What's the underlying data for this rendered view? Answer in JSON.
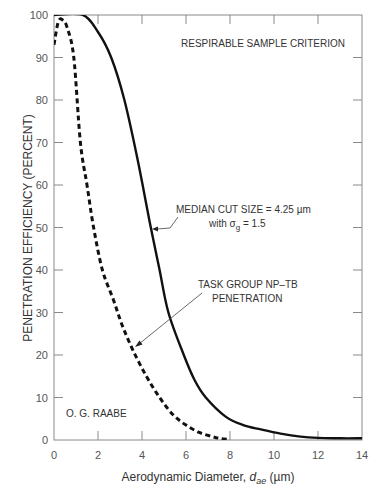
{
  "chart_data": {
    "type": "line",
    "title": "RESPIRABLE SAMPLE CRITERION",
    "xlabel": "Aerodynamic Diameter, d_ae (µm)",
    "xlabel_prefix": "Aerodynamic Diameter, ",
    "xlabel_var": "d",
    "xlabel_sub": "ae",
    "xlabel_unit": " (µm)",
    "ylabel": "PENETRATION EFFICIENCY (PERCENT)",
    "xlim": [
      0,
      14
    ],
    "ylim": [
      0,
      100
    ],
    "xticks": [
      0,
      2,
      4,
      6,
      8,
      10,
      12,
      14
    ],
    "yticks": [
      0,
      10,
      20,
      30,
      40,
      50,
      60,
      70,
      80,
      90,
      100
    ],
    "grid": false,
    "series": [
      {
        "name": "Respirable sample criterion (median cut size = 4.25 µm, σg = 1.5)",
        "style": "solid",
        "x": [
          0,
          1.3,
          2.0,
          2.6,
          3.2,
          3.8,
          4.4,
          4.8,
          5.2,
          5.9,
          6.4,
          6.9,
          7.8,
          8.6,
          9.4,
          10.3,
          11.2,
          12.0,
          13.0,
          14.0
        ],
        "y": [
          100,
          100,
          96,
          90,
          80,
          66,
          50,
          40,
          30,
          20,
          14,
          10,
          5.5,
          3.5,
          2.5,
          1.5,
          0.8,
          0.5,
          0.4,
          0.4
        ]
      },
      {
        "name": "Task Group NP-TB penetration",
        "style": "dashed",
        "x": [
          0,
          0.2,
          0.4,
          0.6,
          0.9,
          1.2,
          1.5,
          1.8,
          2.2,
          2.7,
          3.1,
          3.6,
          4.2,
          4.8,
          5.4,
          6.0,
          6.6,
          7.2,
          7.6,
          8.0
        ],
        "y": [
          93,
          98.5,
          98.8,
          97,
          90,
          70,
          60,
          50,
          40,
          33,
          27,
          21,
          15,
          10,
          6,
          3.5,
          1.8,
          0.8,
          0.3,
          0.1
        ]
      }
    ],
    "annotations": [
      {
        "text": "RESPIRABLE SAMPLE CRITERION"
      },
      {
        "text": "MEDIAN CUT SIZE = 4.25 µm"
      },
      {
        "text": "with σ",
        "sub": "g",
        "after": " = 1.5"
      },
      {
        "text": "TASK GROUP NP–TB"
      },
      {
        "text": "PENETRATION"
      },
      {
        "text": "O. G. RAABE"
      }
    ]
  }
}
